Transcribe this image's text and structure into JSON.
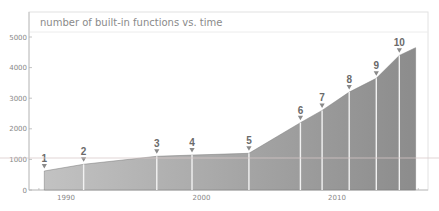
{
  "chart_data": {
    "type": "area",
    "title": "number of built-in functions vs. time",
    "xlabel": "",
    "ylabel": "",
    "xlim": [
      1986.6,
      2018.3
    ],
    "ylim": [
      0,
      5200
    ],
    "x_ticks": [
      1990,
      2000,
      2010
    ],
    "y_ticks": [
      0,
      1000,
      2000,
      3000,
      4000,
      5000
    ],
    "grid": false,
    "legend": null,
    "series": [
      {
        "name": "built-in functions",
        "x": [
          1988.4,
          1991.3,
          1996.7,
          1999.3,
          2003.5,
          2007.3,
          2008.9,
          2010.9,
          2012.9,
          2014.6,
          2015.8
        ],
        "values": [
          620,
          840,
          1100,
          1140,
          1200,
          2200,
          2600,
          3200,
          3650,
          4400,
          4650
        ]
      }
    ],
    "annotations": [
      {
        "label": "1",
        "x": 1988.4,
        "y": 620
      },
      {
        "label": "2",
        "x": 1991.3,
        "y": 840
      },
      {
        "label": "3",
        "x": 1996.7,
        "y": 1100
      },
      {
        "label": "4",
        "x": 1999.3,
        "y": 1140
      },
      {
        "label": "5",
        "x": 2003.5,
        "y": 1200
      },
      {
        "label": "6",
        "x": 2007.3,
        "y": 2200
      },
      {
        "label": "7",
        "x": 2008.9,
        "y": 2600
      },
      {
        "label": "8",
        "x": 2010.9,
        "y": 3200
      },
      {
        "label": "9",
        "x": 2012.9,
        "y": 3650
      },
      {
        "label": "10",
        "x": 2014.6,
        "y": 4400
      }
    ]
  },
  "colors": {
    "fill_left": "#c2c2c2",
    "fill_right": "#8c8c8c",
    "divider": "#f2f2f2",
    "marker": "#8a8a8a",
    "axis": "#b5b5b5",
    "frame": "#e2e2e2"
  }
}
